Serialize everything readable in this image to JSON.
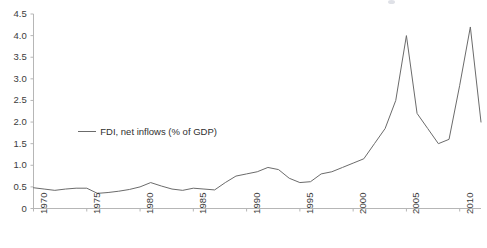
{
  "chart_data": {
    "type": "line",
    "title": "",
    "subtitle": "",
    "xlabel": "",
    "ylabel": "",
    "grid": false,
    "legend_position": "inside-left",
    "legend_entries": [
      "FDI, net inflows (% of GDP)"
    ],
    "line_color": "#6b6b6b",
    "xlim": [
      1970,
      2012
    ],
    "ylim": [
      0,
      4.5
    ],
    "y_ticks": [
      0,
      0.5,
      1.0,
      1.5,
      2.0,
      2.5,
      3.0,
      3.5,
      4.0,
      4.5
    ],
    "y_tick_labels": [
      "0",
      "0.5",
      "1.0",
      "1.5",
      "2.0",
      "2.5",
      "3.0",
      "3.5",
      "4.0",
      "4.5"
    ],
    "x_ticks": [
      1970,
      1975,
      1980,
      1985,
      1990,
      1995,
      2000,
      2005,
      2010
    ],
    "x_tick_labels": [
      "1970",
      "1975",
      "1980",
      "1985",
      "1990",
      "1995",
      "2000",
      "2005",
      "2010"
    ],
    "series": [
      {
        "name": "FDI, net inflows (% of GDP)",
        "x": [
          1970,
          1971,
          1972,
          1973,
          1974,
          1975,
          1976,
          1977,
          1978,
          1979,
          1980,
          1981,
          1982,
          1983,
          1984,
          1985,
          1986,
          1987,
          1988,
          1989,
          1990,
          1991,
          1992,
          1993,
          1994,
          1995,
          1996,
          1997,
          1998,
          1999,
          2000,
          2001,
          2002,
          2003,
          2004,
          2005,
          2006,
          2007,
          2008,
          2009,
          2010,
          2011,
          2012
        ],
        "values": [
          0.48,
          0.45,
          0.42,
          0.45,
          0.47,
          0.47,
          0.35,
          0.37,
          0.4,
          0.44,
          0.5,
          0.6,
          0.52,
          0.45,
          0.42,
          0.47,
          0.45,
          0.43,
          0.6,
          0.75,
          0.8,
          0.85,
          0.95,
          0.9,
          0.7,
          0.6,
          0.62,
          0.8,
          0.85,
          0.95,
          1.05,
          1.15,
          1.5,
          1.85,
          2.5,
          4.0,
          2.2,
          1.85,
          1.5,
          1.6,
          2.85,
          4.2,
          2.0
        ]
      }
    ],
    "annotations": []
  },
  "legend": {
    "label": "FDI, net inflows (% of GDP)"
  }
}
